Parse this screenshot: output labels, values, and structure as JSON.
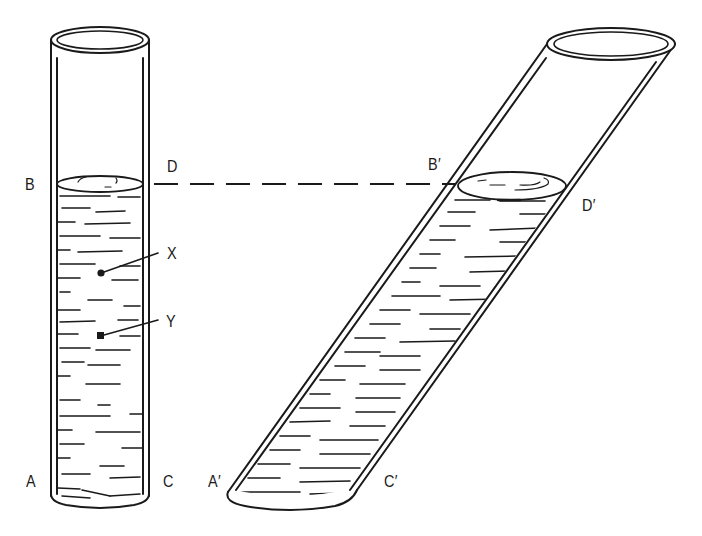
{
  "diagram": {
    "colors": {
      "ink": "#1a1a1a",
      "background": "#ffffff"
    },
    "left_tube": {
      "labels": {
        "top_left": "B",
        "top_right": "D",
        "bottom_left": "A",
        "bottom_right": "C"
      },
      "points": [
        {
          "label": "X",
          "position": "upper point in liquid"
        },
        {
          "label": "Y",
          "position": "lower point in liquid"
        }
      ]
    },
    "right_tube": {
      "labels": {
        "top_left": "B′",
        "top_right": "D′",
        "bottom_left": "A′",
        "bottom_right": "C′"
      }
    },
    "level_line": {
      "style": "dashed",
      "connects": [
        "D",
        "B′"
      ]
    }
  }
}
